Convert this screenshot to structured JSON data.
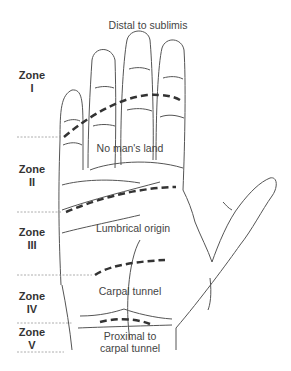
{
  "zones": [
    {
      "name": "Zone",
      "numeral": "I"
    },
    {
      "name": "Zone",
      "numeral": "II"
    },
    {
      "name": "Zone",
      "numeral": "III"
    },
    {
      "name": "Zone",
      "numeral": "IV"
    },
    {
      "name": "Zone",
      "numeral": "V"
    }
  ],
  "regions": {
    "distal": "Distal to sublimis",
    "no_mans_land": "No man's land",
    "lumbrical": "Lumbrical origin",
    "carpal": "Carpal tunnel",
    "proximal_line1": "Proximal to",
    "proximal_line2": "carpal tunnel"
  },
  "colors": {
    "outline": "#555555",
    "dash": "#333333",
    "divider": "#999999",
    "text": "#444444"
  }
}
